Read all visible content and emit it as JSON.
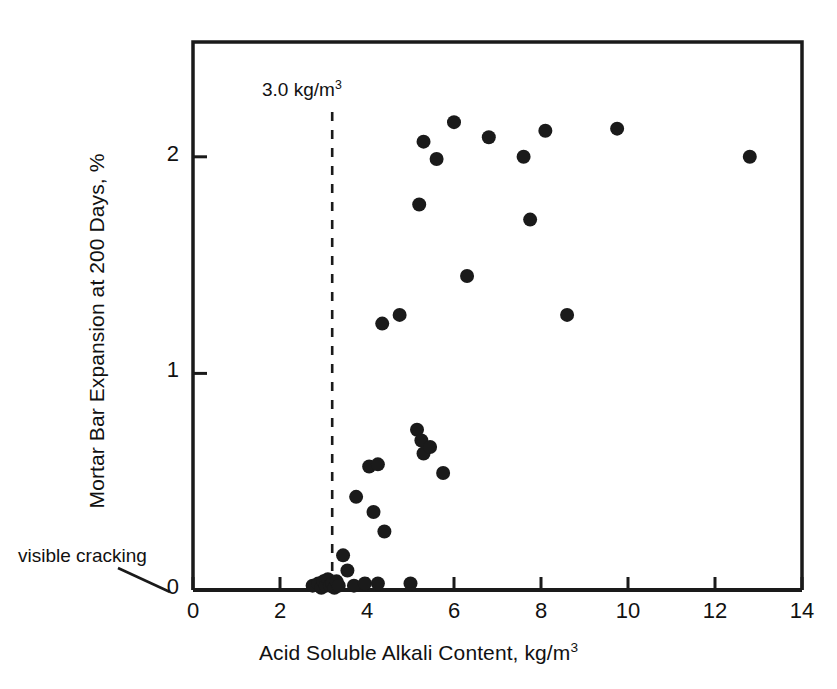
{
  "chart_data": {
    "type": "scatter",
    "title": "",
    "xlabel": "Acid Soluble Alkali Content, kg/m3",
    "ylabel": "Mortar Bar Expansion at 200 Days, %",
    "xlim": [
      0,
      14
    ],
    "ylim": [
      0,
      2.53
    ],
    "xticks": [
      0,
      2,
      4,
      6,
      8,
      10,
      12,
      14
    ],
    "yticks": [
      0,
      1,
      2
    ],
    "xtick_labels": [
      "0",
      "2",
      "4",
      "6",
      "8",
      "10",
      "12",
      "14"
    ],
    "ytick_labels": [
      "0",
      "1",
      "2"
    ],
    "grid": false,
    "legend": "none",
    "marker": "filled-circle",
    "marker_color": "#1a1a1a",
    "points": [
      [
        2.75,
        0.02
      ],
      [
        2.88,
        0.03
      ],
      [
        2.95,
        0.01
      ],
      [
        3.0,
        0.04
      ],
      [
        3.05,
        0.02
      ],
      [
        3.1,
        0.05
      ],
      [
        3.15,
        0.02
      ],
      [
        3.2,
        0.03
      ],
      [
        3.25,
        0.01
      ],
      [
        3.3,
        0.04
      ],
      [
        3.35,
        0.02
      ],
      [
        3.45,
        0.16
      ],
      [
        3.55,
        0.09
      ],
      [
        3.7,
        0.02
      ],
      [
        3.95,
        0.03
      ],
      [
        4.25,
        0.03
      ],
      [
        5.0,
        0.03
      ],
      [
        3.75,
        0.43
      ],
      [
        4.15,
        0.36
      ],
      [
        4.05,
        0.57
      ],
      [
        4.25,
        0.58
      ],
      [
        4.4,
        0.27
      ],
      [
        4.35,
        1.23
      ],
      [
        4.75,
        1.27
      ],
      [
        5.15,
        0.74
      ],
      [
        5.25,
        0.69
      ],
      [
        5.3,
        0.63
      ],
      [
        5.45,
        0.66
      ],
      [
        5.75,
        0.54
      ],
      [
        5.2,
        1.78
      ],
      [
        5.3,
        2.07
      ],
      [
        5.6,
        1.99
      ],
      [
        6.0,
        2.16
      ],
      [
        6.3,
        1.45
      ],
      [
        6.8,
        2.09
      ],
      [
        7.6,
        2.0
      ],
      [
        7.75,
        1.71
      ],
      [
        8.1,
        2.12
      ],
      [
        8.6,
        1.27
      ],
      [
        9.75,
        2.13
      ],
      [
        12.8,
        2.0
      ]
    ],
    "annotations": [
      {
        "name": "threshold-line",
        "type": "vertical-dashed-line",
        "x_value": 3.2,
        "label": "3.0 kg/m3",
        "label_display": "3.0 kg/m",
        "label_superscript": "3"
      },
      {
        "name": "visible-cracking-callout",
        "type": "text-with-leader",
        "label": "visible cracking",
        "points_to": [
          0.0,
          0.0
        ]
      }
    ]
  },
  "labels": {
    "x_axis_title_main": "Acid Soluble Alkali Content, kg/m",
    "x_axis_title_sup": "3",
    "y_axis_title": "Mortar Bar Expansion at 200 Days, %",
    "threshold_main": "3.0 kg/m",
    "threshold_sup": "3",
    "cracking": "visible cracking"
  },
  "colors": {
    "background": "#ffffff",
    "ink": "#1a1a1a",
    "marker": "#1a1a1a",
    "axis": "#1a1a1a"
  }
}
